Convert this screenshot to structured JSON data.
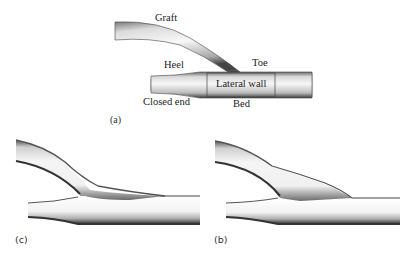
{
  "figure": {
    "panels": [
      {
        "id": "a",
        "label": "(a)",
        "description": "Schematic of end-to-side graft anastomosis with labeled regions"
      },
      {
        "id": "c",
        "label": "(c)",
        "description": "Shaded 3D rendering of anastomosis geometry"
      },
      {
        "id": "b",
        "label": "(b)",
        "description": "Shaded 3D rendering of anastomosis geometry with bulged hood"
      }
    ],
    "annotations": {
      "graft": "Graft",
      "heel": "Heel",
      "toe": "Toe",
      "lateral_wall": "Lateral wall",
      "closed_end": "Closed end",
      "bed": "Bed"
    }
  }
}
